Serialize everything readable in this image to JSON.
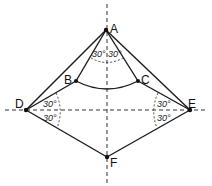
{
  "diagram": {
    "points": {
      "A": {
        "label": "A",
        "x": 106,
        "y": 30
      },
      "B": {
        "label": "B",
        "x": 76,
        "y": 81
      },
      "C": {
        "label": "C",
        "x": 138,
        "y": 81
      },
      "D": {
        "label": "D",
        "x": 26,
        "y": 110
      },
      "E": {
        "label": "E",
        "x": 190,
        "y": 110
      },
      "F": {
        "label": "F",
        "x": 107,
        "y": 157
      }
    },
    "angles": {
      "A_left": "30°",
      "A_right": "30°",
      "D_upper": "30°",
      "D_lower": "30°",
      "E_upper": "30°",
      "E_lower": "30°"
    },
    "colors": {
      "line": "#1a1a1a",
      "dash": "#333333"
    }
  }
}
